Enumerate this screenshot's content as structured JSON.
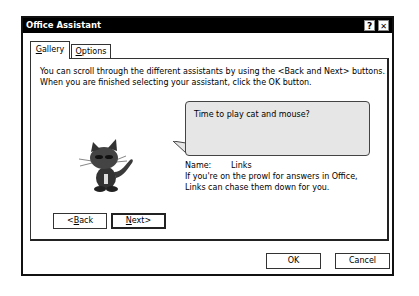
{
  "window": {
    "title": "Office Assistant",
    "help_button": "?",
    "close_button": "✕"
  },
  "tabs": [
    {
      "label": "Gallery",
      "mnemonic": "G",
      "rest": "allery",
      "active": true
    },
    {
      "label": "Options",
      "mnemonic": "O",
      "rest": "ptions",
      "active": false
    }
  ],
  "gallery": {
    "description": "You can scroll through the different assistants by using the <Back and Next> buttons. When you are finished selecting your assistant, click the OK button.",
    "bubble_text": "Time to play cat and mouse?",
    "assistant_image": "cat-character-icon",
    "name_label": "Name:",
    "name_value": "Links",
    "assistant_description": "If you're on the prowl for answers in Office, Links can chase them down for you.",
    "back_button": {
      "pre": "<",
      "mnemonic": "B",
      "post": "ack"
    },
    "next_button": {
      "mnemonic": "N",
      "post": "ext>"
    }
  },
  "footer": {
    "ok_label": "OK",
    "cancel_label": "Cancel"
  }
}
